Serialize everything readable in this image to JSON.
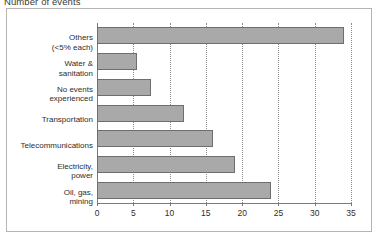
{
  "chart_data": {
    "type": "bar",
    "orientation": "horizontal",
    "title": "Number of events",
    "xlabel": "",
    "ylabel": "",
    "xlim": [
      0,
      35
    ],
    "xticks": [
      0,
      5,
      10,
      15,
      20,
      25,
      30,
      35
    ],
    "grid": true,
    "legend": false,
    "bar_color": "#a9a9a9",
    "bar_border_color": "#6e6e6e",
    "categories": [
      "Others\n(<5% each)",
      "Water &\nsanitation",
      "No events\nexperienced",
      "Transportation",
      "Telecommunications",
      "Electricity,\npower",
      "Oil, gas,\nmining"
    ],
    "values": [
      34,
      5.5,
      7.5,
      12,
      16,
      19,
      24
    ],
    "bars": [
      {
        "label_line1": "Others",
        "label_line2": "(<5% each)",
        "value": 34
      },
      {
        "label_line1": "Water &",
        "label_line2": "sanitation",
        "value": 5.5
      },
      {
        "label_line1": "No events",
        "label_line2": "experienced",
        "value": 7.5
      },
      {
        "label_line1": "Transportation",
        "label_line2": "",
        "value": 12
      },
      {
        "label_line1": "Telecommunications",
        "label_line2": "",
        "value": 16
      },
      {
        "label_line1": "Electricity,",
        "label_line2": "power",
        "value": 19
      },
      {
        "label_line1": "Oil, gas,",
        "label_line2": "mining",
        "value": 24
      }
    ],
    "tick_labels": [
      "0",
      "5",
      "10",
      "15",
      "20",
      "25",
      "30",
      "35"
    ]
  }
}
